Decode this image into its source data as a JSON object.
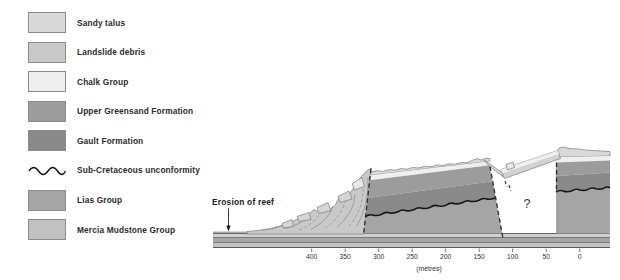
{
  "legend": {
    "items": [
      {
        "label": "Sandy talus",
        "color": "#d9d9d9",
        "type": "swatch"
      },
      {
        "label": "Landslide debris",
        "color": "#c9c9c9",
        "type": "swatch"
      },
      {
        "label": "Chalk Group",
        "color": "#efefef",
        "type": "swatch"
      },
      {
        "label": "Upper Greensand Formation",
        "color": "#9c9c9c",
        "type": "swatch"
      },
      {
        "label": "Gault Formation",
        "color": "#8a8a8a",
        "type": "swatch"
      },
      {
        "label": "Sub-Cretaceous unconformity",
        "color": "#151515",
        "type": "wavy-line"
      },
      {
        "label": "Lias Group",
        "color": "#a5a5a5",
        "type": "swatch"
      },
      {
        "label": "Mercia Mudstone Group",
        "color": "#c1c1c1",
        "type": "swatch"
      }
    ]
  },
  "section": {
    "annotations": {
      "erosion_label": "Erosion of reef",
      "question_mark": "?"
    },
    "axis": {
      "tick_labels": [
        "400",
        "350",
        "300",
        "250",
        "200",
        "150",
        "100",
        "50",
        "0"
      ],
      "unit_label": "(metres)"
    }
  },
  "colors": {
    "sandy_talus": "#d9d9d9",
    "landslide_debris": "#c9c9c9",
    "chalk": "#efefef",
    "upper_greensand": "#9c9c9c",
    "gault": "#8a8a8a",
    "lias": "#a5a5a5",
    "mercia_mudstone": "#c1c1c1",
    "unconformity_line": "#151515",
    "platform_bed_light": "#d0d0d0",
    "platform_bed_mid": "#a6a6a6",
    "platform_bed_lower": "#c3c3c3",
    "debris_block": "#d6d6d6",
    "chalk_block": "#e7e7e7",
    "slab_body": "#d2d2d2"
  }
}
